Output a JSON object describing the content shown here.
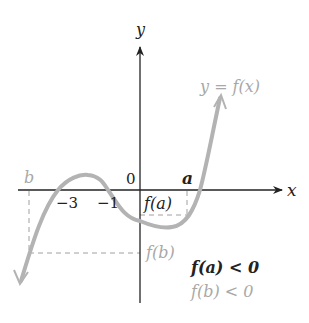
{
  "diagram": {
    "axes": {
      "x_label": "x",
      "y_label": "y",
      "origin_label": "0",
      "tick_labels": [
        "−3",
        "−1"
      ]
    },
    "points": {
      "a_label": "a",
      "b_label": "b",
      "fa_label": "f(a)",
      "fb_label": "f(b)"
    },
    "curve_label": "y = f(x)",
    "statements": {
      "fa": "f(a) < 0",
      "fb": "f(b) < 0"
    },
    "colors": {
      "axis": "#222222",
      "curve": "#b3b3b3",
      "dashed": "#a0a0a0",
      "emphasis_text": "#222222",
      "muted_text": "#a8a8a8"
    }
  }
}
